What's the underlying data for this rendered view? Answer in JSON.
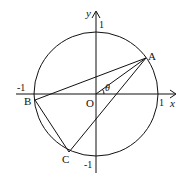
{
  "diagram": {
    "type": "unit-circle-geometry",
    "axes": {
      "x_label": "x",
      "y_label": "y",
      "ticks": {
        "x_pos": "1",
        "x_neg": "-1",
        "y_pos": "1",
        "y_neg": "-1"
      }
    },
    "origin_label": "O",
    "angle_label": "θ",
    "points": [
      {
        "name": "A",
        "label": "A"
      },
      {
        "name": "B",
        "label": "B"
      },
      {
        "name": "C",
        "label": "C"
      }
    ],
    "segments": [
      "AB",
      "BC",
      "CA",
      "OA"
    ],
    "colors": {
      "stroke": "#111111",
      "background": "#ffffff"
    }
  }
}
